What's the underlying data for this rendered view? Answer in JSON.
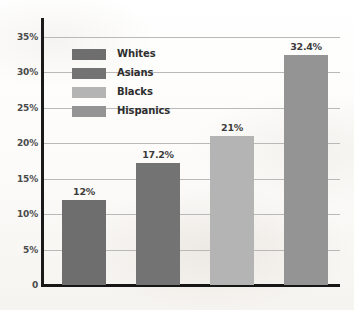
{
  "chart_data": {
    "type": "bar",
    "title": "",
    "subtitle": "",
    "xlabel": "",
    "ylabel": "",
    "categories": [
      "Whites",
      "Asians",
      "Blacks",
      "Hispanics"
    ],
    "values": [
      12,
      17.2,
      21,
      32.4
    ],
    "value_labels": [
      "12%",
      "17.2%",
      "21%",
      "32.4%"
    ],
    "bar_colors": [
      "#6e6e6e",
      "#737373",
      "#b4b4b4",
      "#949494"
    ],
    "ylim": [
      0,
      35
    ],
    "yticks": [
      0,
      5,
      10,
      15,
      20,
      25,
      30,
      35
    ],
    "ytick_labels": [
      "0",
      "5%",
      "10%",
      "15%",
      "20%",
      "25%",
      "30%",
      "35%"
    ],
    "grid": true,
    "legend_position": "upper left",
    "legend": [
      {
        "label": "Whites",
        "color": "#6e6e6e"
      },
      {
        "label": "Asians",
        "color": "#737373"
      },
      {
        "label": "Blacks",
        "color": "#b4b4b4"
      },
      {
        "label": "Hispanics",
        "color": "#949494"
      }
    ]
  },
  "axis": {
    "spine_color": "#1a1a1a",
    "gridline_color": "#b9b9b9"
  },
  "page": {
    "background": "#fdfdfc"
  }
}
